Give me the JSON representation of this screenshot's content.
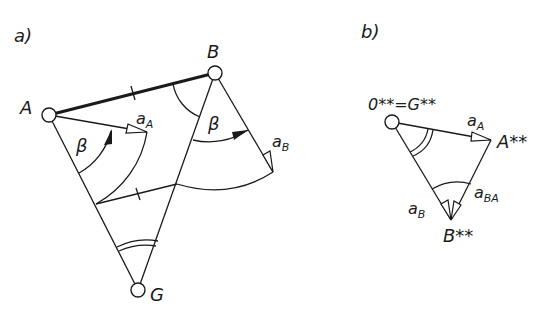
{
  "panel_a": {
    "label": "a)",
    "points": {
      "A": {
        "label": "A",
        "x": 49,
        "y": 115
      },
      "B": {
        "label": "B",
        "x": 215,
        "y": 73
      },
      "G": {
        "label": "G",
        "x": 138,
        "y": 290
      }
    },
    "angle_label_1": "β",
    "angle_label_2": "β",
    "vector_a_A": {
      "base": "a",
      "sub": "A"
    },
    "vector_a_B": {
      "base": "a",
      "sub": "B"
    }
  },
  "panel_b": {
    "label": "b)",
    "origin_label": "0**=G**",
    "point_A_label": "A**",
    "point_B_label": "B**",
    "vector_a_A": {
      "base": "a",
      "sub": "A"
    },
    "vector_a_B": {
      "base": "a",
      "sub": "B"
    },
    "vector_a_BA": {
      "base": "a",
      "sub": "BA"
    }
  },
  "colors": {
    "ink": "#1a1a1a",
    "background": "#ffffff"
  }
}
